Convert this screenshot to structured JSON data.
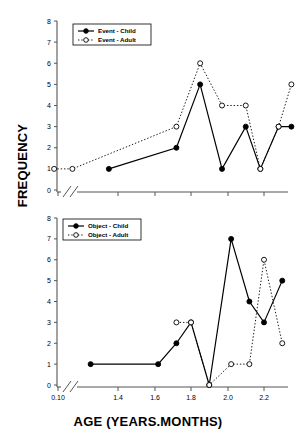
{
  "figure": {
    "xlabel": "AGE (YEARS.MONTHS)",
    "ylabel": "FREQUENCY",
    "axis_color": "#555555",
    "child_color": "#000000",
    "adult_color": "#000000"
  },
  "axes": {
    "y_ticks": [
      "0",
      "1",
      "2",
      "3",
      "4",
      "5",
      "6",
      "7",
      "8"
    ],
    "x_ticks": [
      "0.10",
      "1.4",
      "1.6",
      "1.8",
      "2.0",
      "2.2"
    ],
    "break_symbol": "//"
  },
  "panels": {
    "top": {
      "legend": [
        "Event - Child",
        "Event - Adult"
      ]
    },
    "bottom": {
      "legend": [
        "Object - Child",
        "Object - Adult"
      ]
    }
  },
  "chart_data": [
    {
      "type": "line",
      "title": "Event",
      "xlabel": "AGE (YEARS.MONTHS)",
      "ylabel": "FREQUENCY",
      "ylim": [
        0,
        8
      ],
      "xlim": [
        1.0,
        2.35
      ],
      "grid": false,
      "legend_position": "top-left",
      "axis_break": "0.10 to 1.3",
      "series": [
        {
          "name": "Event - Child",
          "marker": "filled-circle",
          "line": "solid",
          "points": [
            {
              "x": 1.35,
              "y": 1
            },
            {
              "x": 1.72,
              "y": 2
            },
            {
              "x": 1.85,
              "y": 5
            },
            {
              "x": 1.97,
              "y": 1
            },
            {
              "x": 2.1,
              "y": 3
            },
            {
              "x": 2.18,
              "y": 1
            },
            {
              "x": 2.28,
              "y": 3
            },
            {
              "x": 2.35,
              "y": 3
            }
          ]
        },
        {
          "name": "Event - Adult",
          "marker": "open-circle",
          "line": "dotted",
          "points": [
            {
              "x": 1.05,
              "y": 1
            },
            {
              "x": 1.15,
              "y": 1
            },
            {
              "x": 1.72,
              "y": 3
            },
            {
              "x": 1.85,
              "y": 6
            },
            {
              "x": 1.97,
              "y": 4
            },
            {
              "x": 2.1,
              "y": 4
            },
            {
              "x": 2.18,
              "y": 1
            },
            {
              "x": 2.28,
              "y": 3
            },
            {
              "x": 2.35,
              "y": 5
            }
          ]
        }
      ]
    },
    {
      "type": "line",
      "title": "Object",
      "xlabel": "AGE (YEARS.MONTHS)",
      "ylabel": "FREQUENCY",
      "ylim": [
        0,
        8
      ],
      "xlim": [
        1.0,
        2.35
      ],
      "grid": false,
      "legend_position": "top-left",
      "axis_break": "0.10 to 1.3",
      "series": [
        {
          "name": "Object - Child",
          "marker": "filled-circle",
          "line": "solid",
          "points": [
            {
              "x": 1.25,
              "y": 1
            },
            {
              "x": 1.62,
              "y": 1
            },
            {
              "x": 1.72,
              "y": 2
            },
            {
              "x": 1.8,
              "y": 3
            },
            {
              "x": 1.9,
              "y": 0
            },
            {
              "x": 2.02,
              "y": 7
            },
            {
              "x": 2.12,
              "y": 4
            },
            {
              "x": 2.2,
              "y": 3
            },
            {
              "x": 2.3,
              "y": 5
            }
          ]
        },
        {
          "name": "Object - Adult",
          "marker": "open-circle",
          "line": "dotted",
          "points": [
            {
              "x": 1.72,
              "y": 3
            },
            {
              "x": 1.8,
              "y": 3
            },
            {
              "x": 1.9,
              "y": 0
            },
            {
              "x": 2.02,
              "y": 1
            },
            {
              "x": 2.12,
              "y": 1
            },
            {
              "x": 2.2,
              "y": 6
            },
            {
              "x": 2.3,
              "y": 2
            }
          ]
        }
      ]
    }
  ]
}
